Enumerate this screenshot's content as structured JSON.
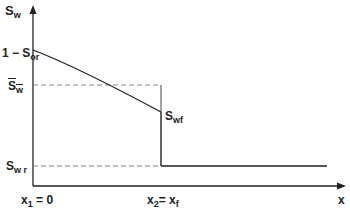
{
  "diagram": {
    "y_axis_label": "S",
    "y_axis_label_sub": "w",
    "x_axis_label": "x",
    "labels": {
      "one_minus_sor": "1 − S",
      "one_minus_sor_sub": "or",
      "sw_bar": "S",
      "sw_bar_sub": "w",
      "swf": "S",
      "swf_sub": "wf",
      "swr": "S",
      "swr_sub": "w r",
      "x1": "x",
      "x1_sub": "1",
      "x1_eq": " = 0",
      "x2": "x",
      "x2_sub": "2",
      "x2_eq": "= x",
      "x2_eq_sub": "f"
    },
    "colors": {
      "line": "#222222",
      "dashed": "#888888"
    }
  }
}
